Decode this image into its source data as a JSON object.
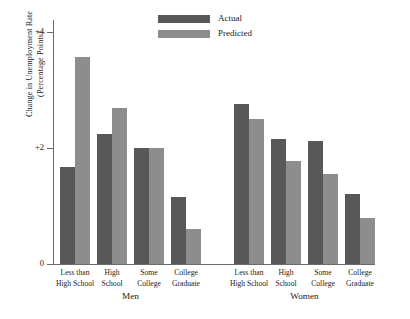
{
  "chart_data": {
    "type": "bar",
    "title": "",
    "xlabel": "",
    "ylabel": "Change in Unemployment Rate (Percentage Points)",
    "ylabel_line1": "Change in Unemployment Rate",
    "ylabel_line2": "(Percentage Points)",
    "ylim": [
      0,
      4.2
    ],
    "ytick_labels": [
      "0",
      "+2",
      "+4"
    ],
    "ytick_values": [
      0,
      2,
      4
    ],
    "grid": false,
    "legend_position": "top-center",
    "legend": [
      "Actual",
      "Predicted"
    ],
    "colors": {
      "actual": "#585858",
      "predicted": "#8d8d8d",
      "axis": "#6b6b6b",
      "text": "#1a1a1a",
      "background": "#ffffff"
    },
    "group_labels": [
      "Men",
      "Women"
    ],
    "categories": [
      "Less than High School",
      "High School",
      "Some College",
      "College Graduate"
    ],
    "category_lines": [
      [
        "Less than",
        "High School"
      ],
      [
        "High",
        "School"
      ],
      [
        "Some",
        "College"
      ],
      [
        "College",
        "Graduate"
      ]
    ],
    "groups": [
      {
        "name": "Men",
        "series": [
          {
            "name": "Actual",
            "values": [
              1.67,
              2.23,
              2.0,
              1.16
            ]
          },
          {
            "name": "Predicted",
            "values": [
              3.57,
              2.68,
              2.0,
              0.6
            ]
          }
        ]
      },
      {
        "name": "Women",
        "series": [
          {
            "name": "Actual",
            "values": [
              2.75,
              2.15,
              2.12,
              1.21
            ]
          },
          {
            "name": "Predicted",
            "values": [
              2.5,
              1.78,
              1.55,
              0.8
            ]
          }
        ]
      }
    ]
  }
}
